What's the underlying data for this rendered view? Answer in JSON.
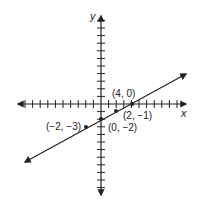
{
  "chart_data": {
    "type": "line",
    "title": "",
    "xlabel": "x",
    "ylabel": "y",
    "grid": false,
    "legend": null,
    "axis": {
      "x_ticks_each_side": 11,
      "y_ticks_each_side": 11,
      "tick_spacing_units": 1
    },
    "series": [
      {
        "name": "line",
        "equation": "y = x/2 - 2",
        "both_ends_arrows": true,
        "points": [
          {
            "x": -2,
            "y": -3,
            "label": "(−2, −3)"
          },
          {
            "x": 0,
            "y": -2,
            "label": "(0, −2)"
          },
          {
            "x": 2,
            "y": -1,
            "label": "(2, −1)"
          },
          {
            "x": 4,
            "y": 0,
            "label": "(4, 0)"
          }
        ]
      }
    ],
    "colors": {
      "ink": "#222222",
      "background": "#ffffff"
    }
  }
}
